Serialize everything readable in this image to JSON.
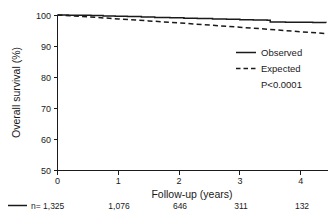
{
  "chart_data": {
    "type": "line",
    "title": "",
    "xlabel": "Follow-up (years)",
    "ylabel": "Overall survival (%)",
    "xlim": [
      0,
      4.45
    ],
    "ylim": [
      50,
      100
    ],
    "xticks": [
      "0",
      "1",
      "2",
      "3",
      "4"
    ],
    "xtick_values": [
      0,
      1,
      2,
      3,
      4
    ],
    "yticks": [
      "50",
      "60",
      "70",
      "80",
      "90",
      "100"
    ],
    "ytick_values": [
      50,
      60,
      70,
      80,
      90,
      100
    ],
    "grid": false,
    "legend_position": "center-right",
    "annotations": [
      {
        "name": "p-value",
        "text": "P<0.0001"
      }
    ],
    "series": [
      {
        "name": "Observed",
        "style": "solid",
        "color": "#1a1a1a",
        "step": true,
        "x": [
          0.0,
          0.18,
          0.36,
          0.55,
          0.75,
          0.95,
          1.15,
          1.38,
          1.6,
          1.85,
          2.08,
          2.3,
          2.55,
          2.78,
          3.0,
          3.22,
          3.45,
          3.5,
          3.75,
          4.0,
          4.2,
          4.42
        ],
        "y": [
          100.0,
          99.95,
          99.9,
          99.8,
          99.7,
          99.6,
          99.5,
          99.35,
          99.2,
          99.1,
          98.95,
          98.85,
          98.7,
          98.6,
          98.45,
          98.35,
          98.3,
          97.75,
          97.7,
          97.65,
          97.6,
          97.55
        ]
      },
      {
        "name": "Expected",
        "style": "dashed",
        "color": "#1a1a1a",
        "step": false,
        "x": [
          0.0,
          0.5,
          1.0,
          1.5,
          2.0,
          2.5,
          3.0,
          3.5,
          4.0,
          4.42
        ],
        "y": [
          100.0,
          99.4,
          98.75,
          98.1,
          97.45,
          96.75,
          96.05,
          95.35,
          94.6,
          94.0
        ]
      }
    ],
    "risk_table": {
      "prefix": "n=",
      "row_label_series": "Observed",
      "at_times": [
        0,
        1,
        2,
        3,
        4
      ],
      "counts": [
        "1,325",
        "1,076",
        "646",
        "311",
        "132"
      ]
    }
  },
  "legend": {
    "items": [
      {
        "label": "Observed",
        "style": "solid"
      },
      {
        "label": "Expected",
        "style": "dashed"
      }
    ],
    "pvalue": "P<0.0001"
  },
  "axes": {
    "x_title": "Follow-up (years)",
    "y_title": "Overall survival (%)",
    "x_tick_labels": [
      "0",
      "1",
      "2",
      "3",
      "4"
    ],
    "y_tick_labels": [
      "100",
      "90",
      "80",
      "70",
      "60",
      "50"
    ]
  },
  "risk_row": {
    "first_cell": "n= 1,325",
    "cells": [
      "1,076",
      "646",
      "311",
      "132"
    ]
  },
  "colors": {
    "ink": "#1a1a1a",
    "background": "#ffffff"
  }
}
